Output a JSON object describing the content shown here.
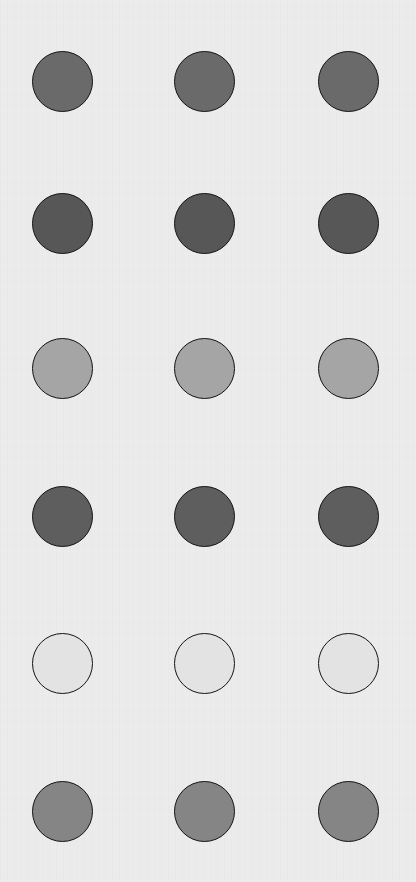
{
  "canvas": {
    "width": 416,
    "height": 882,
    "background": "#ebebeb"
  },
  "columns_x": [
    62,
    204,
    348
  ],
  "rows": [
    {
      "y": 81,
      "fill": "#6a6a6a"
    },
    {
      "y": 223,
      "fill": "#575757"
    },
    {
      "y": 368,
      "fill": "#a5a5a5"
    },
    {
      "y": 516,
      "fill": "#5e5e5e"
    },
    {
      "y": 663,
      "fill": "#e3e3e3"
    },
    {
      "y": 811,
      "fill": "#858585"
    }
  ],
  "circle": {
    "diameter": 61,
    "border_color": "#141414"
  }
}
